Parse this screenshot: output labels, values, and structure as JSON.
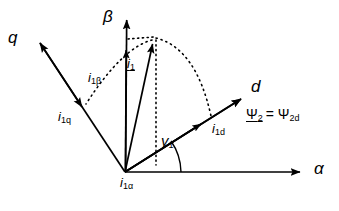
{
  "diagram": {
    "type": "phasor-vector-diagram",
    "background_color": "#ffffff",
    "stroke_color": "#000000",
    "origin": {
      "x": 125,
      "y": 172
    },
    "axes": [
      {
        "name": "alpha",
        "label": "α",
        "label_x": 313,
        "label_y": 163,
        "tip_x": 308,
        "tip_y": 172
      },
      {
        "name": "beta",
        "label": "β",
        "label_x": 104,
        "label_y": 10,
        "tip_x": 127,
        "tip_y": 12
      },
      {
        "name": "q",
        "label": "q",
        "label_x": 10,
        "label_y": 30,
        "tip_x": 33,
        "tip_y": 36
      },
      {
        "name": "d",
        "label": "d",
        "label_x": 252,
        "label_y": 83,
        "tip_x": 248,
        "tip_y": 93
      }
    ],
    "vectors": [
      {
        "name": "i1",
        "label": "i",
        "sub": "1",
        "underlined": true,
        "label_x": 126,
        "label_y": 58,
        "tip_x": 155,
        "tip_y": 37
      },
      {
        "name": "i1-beta",
        "label": "i",
        "sub": "1β",
        "underlined": false,
        "label_x": 88,
        "label_y": 78,
        "tip_x": 127,
        "tip_y": 42
      },
      {
        "name": "i1-q",
        "label": "i",
        "sub": "1q",
        "underlined": false,
        "label_x": 58,
        "label_y": 117,
        "tip_x": 74,
        "tip_y": 105
      },
      {
        "name": "i1-d",
        "label": "i",
        "sub": "1d",
        "underlined": false,
        "label_x": 213,
        "label_y": 129,
        "tip_x": 208,
        "tip_y": 119
      },
      {
        "name": "psi2",
        "label": "Ψ",
        "sub": "2",
        "underlined": true,
        "label_x": 248,
        "label_y": 113,
        "tip_x": 248,
        "tip_y": 93
      }
    ],
    "labels": {
      "flux_equation": "= Ψ",
      "flux_equation_sub": "2d",
      "angle_gamma": "γ",
      "angle_gamma_sub": "1",
      "angle_gamma_x": 162,
      "angle_gamma_y": 140,
      "i1_alpha": "i",
      "i1_alpha_sub": "1α",
      "i1_alpha_x": 121,
      "i1_alpha_y": 182
    }
  }
}
